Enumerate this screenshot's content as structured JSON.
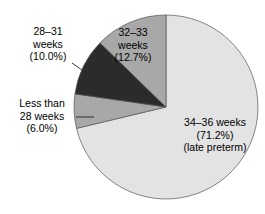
{
  "chart_data": {
    "type": "pie",
    "title": "",
    "subtitle": "",
    "xlabel": "",
    "ylabel": "",
    "legend_position": "none",
    "grid": false,
    "start_angle_deg": 0,
    "direction": "clockwise",
    "units": "percent",
    "categories": [
      "34–36 weeks",
      "Less than 28 weeks",
      "28–31 weeks",
      "32–33 weeks"
    ],
    "values": [
      71.2,
      6.0,
      10.0,
      12.7
    ],
    "slices": [
      {
        "id": "slice-34-36",
        "category": "34–36 weeks",
        "value": 71.2,
        "value_text": "(71.2%)",
        "note": "(late preterm)",
        "color": "#e3e3e3",
        "label_placement": "inside"
      },
      {
        "id": "slice-less-than-28",
        "category": "Less than 28 weeks",
        "value": 6.0,
        "value_text": "(6.0%)",
        "note": "",
        "color": "#a8a8a8",
        "label_placement": "outside-left"
      },
      {
        "id": "slice-28-31",
        "category": "28–31 weeks",
        "value": 10.0,
        "value_text": "(10.0%)",
        "note": "",
        "color": "#2b2b2b",
        "label_placement": "outside-left"
      },
      {
        "id": "slice-32-33",
        "category": "32–33 weeks",
        "value": 12.7,
        "value_text": "(12.7%)",
        "note": "",
        "color": "#a8a8a8",
        "label_placement": "inside"
      }
    ]
  },
  "labels": {
    "label_32_33": {
      "line1": "32–33",
      "line2": "weeks",
      "line3": "(12.7%)"
    },
    "label_34_36": {
      "line1": "34–36 weeks",
      "line2": "(71.2%)",
      "line3": "(late preterm)"
    },
    "label_28_31": {
      "line1": "28–31",
      "line2": "weeks",
      "line3": "(10.0%)"
    },
    "label_less_than_28": {
      "line1": "Less than",
      "line2": "28 weeks",
      "line3": "(6.0%)"
    }
  },
  "colors": {
    "light_gray": "#e3e3e3",
    "medium_gray": "#a8a8a8",
    "dark": "#2b2b2b",
    "outline": "#555555",
    "text": "#000000",
    "background": "#ffffff"
  },
  "geometry": {
    "center_x": 166,
    "center_y": 107,
    "radius": 92
  }
}
